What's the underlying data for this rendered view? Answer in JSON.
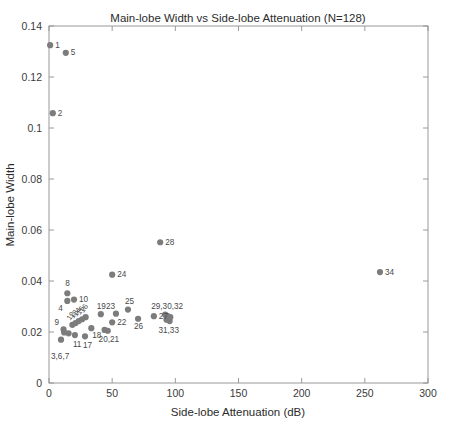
{
  "chart_data": {
    "type": "scatter",
    "title": "Main-lobe Width vs Side-lobe Attenuation (N=128)",
    "xlabel": "Side-lobe Attenuation (dB)",
    "ylabel": "Main-lobe Width",
    "xlim": [
      0,
      300
    ],
    "ylim": [
      0,
      0.14
    ],
    "xticks": [
      0,
      50,
      100,
      150,
      200,
      250,
      300
    ],
    "xtick_labels": [
      "0",
      "50",
      "100",
      "150",
      "200",
      "250",
      "300"
    ],
    "yticks": [
      0,
      0.02,
      0.04,
      0.06,
      0.08,
      0.1,
      0.12,
      0.14
    ],
    "ytick_labels": [
      "0",
      "0.02",
      "0.04",
      "0.06",
      "0.08",
      "0.1",
      "0.12",
      "0.14"
    ],
    "grid": false,
    "legend": null,
    "marker_color": "#7c7c7c",
    "axis_color": "#8f8f8f",
    "background": "#ffffff",
    "points": [
      {
        "id": 1,
        "x": 0.9,
        "y": 0.1325,
        "label": "1",
        "lx": 5,
        "ly": 2.5,
        "rot": 0
      },
      {
        "id": 5,
        "x": 13.3,
        "y": 0.1295,
        "label": "5",
        "lx": 5,
        "ly": 2.5,
        "rot": 0
      },
      {
        "id": 2,
        "x": 3.0,
        "y": 0.1058,
        "label": "2",
        "lx": 5,
        "ly": 2.5,
        "rot": 0
      },
      {
        "id": 28,
        "x": 88.0,
        "y": 0.0552,
        "label": "28",
        "lx": 5,
        "ly": 2.5,
        "rot": 0
      },
      {
        "id": 34,
        "x": 262.0,
        "y": 0.0435,
        "label": "34",
        "lx": 5,
        "ly": 2.5,
        "rot": 0
      },
      {
        "id": 24,
        "x": 50.0,
        "y": 0.0425,
        "label": "24",
        "lx": 5,
        "ly": 2.5,
        "rot": 0
      },
      {
        "id": 8,
        "x": 14.5,
        "y": 0.0352,
        "label": "8",
        "lx": -2,
        "ly": -7,
        "rot": 0
      },
      {
        "id": 10,
        "x": 19.8,
        "y": 0.0327,
        "label": "10",
        "lx": 5,
        "ly": 2.5,
        "rot": 0
      },
      {
        "id": 4,
        "x": 14.5,
        "y": 0.0322,
        "label": "4",
        "lx": -9,
        "ly": 10,
        "rot": 0
      },
      {
        "id": 25,
        "x": 62.5,
        "y": 0.0288,
        "label": "25",
        "lx": -3,
        "ly": -6,
        "rot": 0
      },
      {
        "id": 23,
        "x": 53.0,
        "y": 0.0272,
        "label": "23",
        "lx": -10,
        "ly": -5,
        "rot": 0
      },
      {
        "id": 19,
        "x": 41.0,
        "y": 0.027,
        "label": "19",
        "lx": -4,
        "ly": -5.5,
        "rot": 0
      },
      {
        "id": 27,
        "x": 83.0,
        "y": 0.0262,
        "label": "27",
        "lx": 5,
        "ly": 2.5,
        "rot": 0
      },
      {
        "id": 26,
        "x": 70.5,
        "y": 0.0252,
        "label": "26",
        "lx": -4,
        "ly": 10,
        "rot": 0
      },
      {
        "id": 22,
        "x": 50.0,
        "y": 0.0238,
        "label": "22",
        "lx": 5,
        "ly": 2.5,
        "rot": 0
      },
      {
        "id": 16,
        "x": 29.0,
        "y": 0.0258,
        "label": "16",
        "lx": -2,
        "ly": -4,
        "rot": -55
      },
      {
        "id": 15,
        "x": 26.2,
        "y": 0.025,
        "label": "15",
        "lx": -2,
        "ly": -4,
        "rot": -55
      },
      {
        "id": 14,
        "x": 23.5,
        "y": 0.0243,
        "label": "14",
        "lx": -2,
        "ly": -4,
        "rot": -55
      },
      {
        "id": 13,
        "x": 21.0,
        "y": 0.0235,
        "label": "13",
        "lx": -2,
        "ly": -4,
        "rot": -55
      },
      {
        "id": 12,
        "x": 18.5,
        "y": 0.0228,
        "label": "12",
        "lx": -2,
        "ly": -4,
        "rot": -55
      },
      {
        "id": 9,
        "x": 11.5,
        "y": 0.021,
        "label": "9",
        "lx": -9,
        "ly": -4,
        "rot": 0
      },
      {
        "id": 18,
        "x": 33.5,
        "y": 0.0215,
        "label": "18",
        "lx": 1,
        "ly": 10,
        "rot": 0
      },
      {
        "id": 20,
        "x": 44.0,
        "y": 0.0208,
        "label": "20,21",
        "lx": -6,
        "ly": 12,
        "rot": 0
      },
      {
        "id": 21,
        "x": 46.5,
        "y": 0.0205,
        "label": "",
        "lx": 0,
        "ly": 0,
        "rot": 0
      },
      {
        "id": 11,
        "x": 20.5,
        "y": 0.0188,
        "label": "11",
        "lx": -2,
        "ly": 12,
        "rot": 0
      },
      {
        "id": 17,
        "x": 28.5,
        "y": 0.0183,
        "label": "17",
        "lx": -2,
        "ly": 12,
        "rot": 0
      },
      {
        "id": 3,
        "x": 9.5,
        "y": 0.017,
        "label": "3,6,7",
        "lx": -10,
        "ly": 19,
        "rot": 0
      },
      {
        "id": 6,
        "x": 12.0,
        "y": 0.0198,
        "label": "",
        "lx": 0,
        "ly": 0,
        "rot": 0
      },
      {
        "id": 7,
        "x": 15.5,
        "y": 0.0195,
        "label": "",
        "lx": 0,
        "ly": 0,
        "rot": 0
      },
      {
        "id": 29,
        "x": 92.0,
        "y": 0.0268,
        "label": "29,30,32",
        "lx": -14,
        "ly": -6,
        "rot": 0
      },
      {
        "id": 30,
        "x": 94.0,
        "y": 0.0262,
        "label": "",
        "lx": 0,
        "ly": 0,
        "rot": 0
      },
      {
        "id": 32,
        "x": 96.0,
        "y": 0.0258,
        "label": "",
        "lx": 0,
        "ly": 0,
        "rot": 0
      },
      {
        "id": 31,
        "x": 93.0,
        "y": 0.0248,
        "label": "31,33",
        "lx": -8,
        "ly": 13,
        "rot": 0
      },
      {
        "id": 33,
        "x": 95.5,
        "y": 0.0243,
        "label": "",
        "lx": 0,
        "ly": 0,
        "rot": 0
      }
    ]
  }
}
